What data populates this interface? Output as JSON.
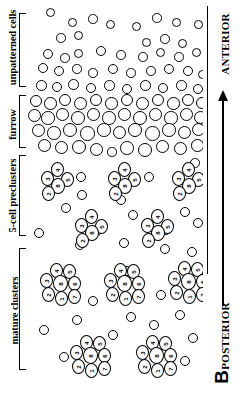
{
  "figure": {
    "panel_label": "B",
    "orientation_note": "rotated-90",
    "type": "schematic-diagram"
  },
  "region_labels": [
    {
      "id": "unpatterned",
      "text": "unpatterned cells"
    },
    {
      "id": "furrow",
      "text": "furrow"
    },
    {
      "id": "preclusters",
      "text": "5-cell preclusters"
    },
    {
      "id": "mature",
      "text": "mature clusters"
    }
  ],
  "axis": {
    "anterior_label": "ANTERIOR",
    "posterior_label": "POSTERIOR",
    "arrow_direction": "anterior",
    "arrow_name": "anterior-posterior-axis-arrow"
  },
  "clusters": {
    "precluster_cell_labels": [
      "2",
      "3",
      "4",
      "5",
      "8"
    ],
    "mature_cell_labels": [
      "1",
      "2",
      "3",
      "4",
      "5",
      "6",
      "7",
      "8"
    ]
  },
  "colors": {
    "stroke": "#000000",
    "fill": "#ffffff",
    "background": "#ffffff"
  }
}
